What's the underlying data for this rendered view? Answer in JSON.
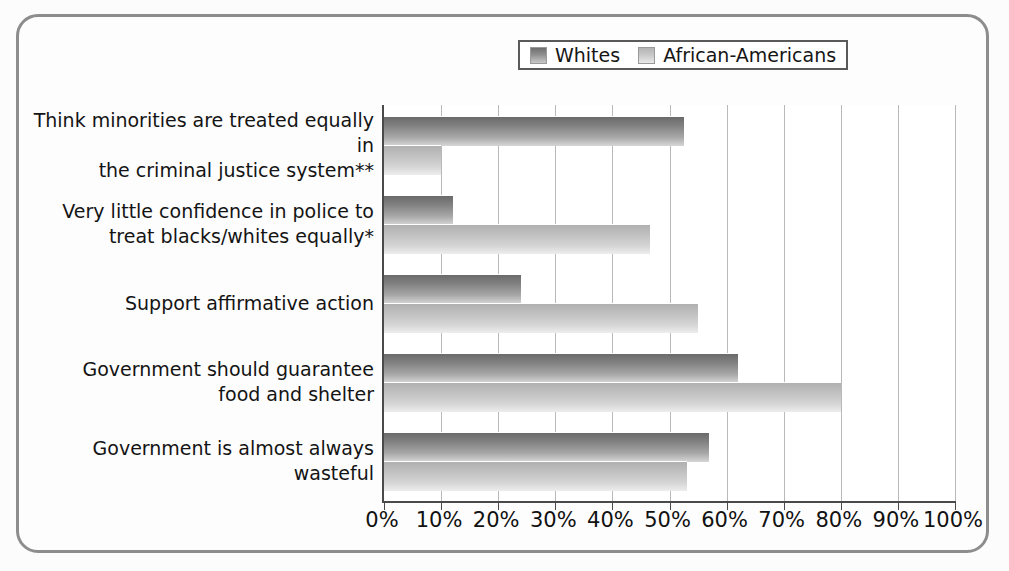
{
  "chart_data": {
    "type": "bar",
    "orientation": "horizontal",
    "title": "",
    "xlabel": "",
    "ylabel": "",
    "xlim": [
      0,
      100
    ],
    "grid": true,
    "legend_position": "top-center",
    "categories": [
      "Think minorities are treated equally in\nthe criminal justice system**",
      "Very little confidence in police to\ntreat blacks/whites equally*",
      "Support affirmative action",
      "Government should guarantee\nfood and shelter",
      "Government is almost always wasteful"
    ],
    "series": [
      {
        "name": "Whites",
        "color": "#8f8f8f",
        "values": [
          52.5,
          12,
          24,
          62,
          57
        ]
      },
      {
        "name": "African-Americans",
        "color": "#c8c8c8",
        "values": [
          10,
          46.5,
          55,
          80,
          53
        ]
      }
    ],
    "xticks": [
      0,
      10,
      20,
      30,
      40,
      50,
      60,
      70,
      80,
      90,
      100
    ],
    "xticklabels": [
      "0%",
      "10%",
      "20%",
      "30%",
      "40%",
      "50%",
      "60%",
      "70%",
      "80%",
      "90%",
      "100%"
    ]
  },
  "legend": {
    "entries": [
      {
        "label": "Whites"
      },
      {
        "label": "African-Americans"
      }
    ]
  }
}
